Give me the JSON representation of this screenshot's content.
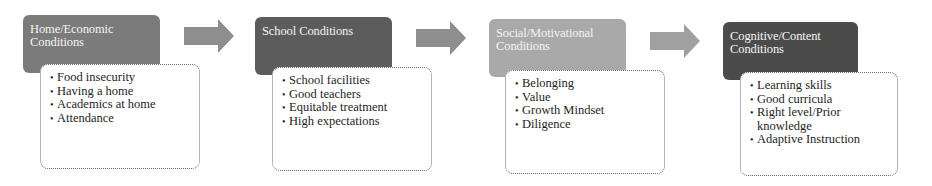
{
  "diagram": {
    "colors": {
      "stage1_header": "#7b7b7b",
      "stage2_header": "#5c5c5c",
      "stage3_header": "#a9a9a9",
      "stage4_header": "#4b4b4b",
      "arrow": "#8e8e8e",
      "content_border": "#6a6a6a"
    },
    "stages": [
      {
        "title": "Home/Economic Conditions",
        "items": [
          "Food insecurity",
          "Having a home",
          "Academics at home",
          "Attendance"
        ]
      },
      {
        "title": "School Conditions",
        "items": [
          "School facilities",
          "Good teachers",
          "Equitable treatment",
          "High expectations"
        ]
      },
      {
        "title": "Social/Motivational Conditions",
        "items": [
          "Belonging",
          "Value",
          "Growth Mindset",
          "Diligence"
        ]
      },
      {
        "title": "Cognitive/Content Conditions",
        "items": [
          "Learning skills",
          "Good curricula",
          "Right level/Prior knowledge",
          "Adaptive Instruction"
        ]
      }
    ],
    "arrows": [
      {
        "icon": "right-arrow-icon"
      },
      {
        "icon": "right-arrow-icon"
      },
      {
        "icon": "right-arrow-icon"
      }
    ]
  }
}
